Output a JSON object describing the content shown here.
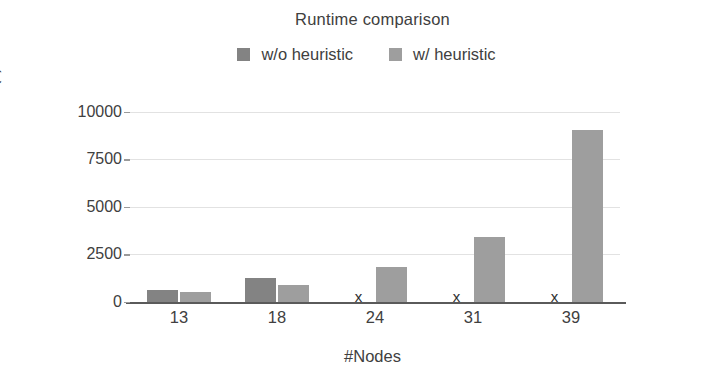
{
  "chart_data": {
    "type": "bar",
    "title": "Runtime comparison",
    "xlabel": "#Nodes",
    "ylabel": "Runtime (s)",
    "categories": [
      "13",
      "18",
      "24",
      "31",
      "39"
    ],
    "series": [
      {
        "name": "w/o heuristic",
        "color": "#838383",
        "values": [
          620,
          1270,
          null,
          null,
          null
        ],
        "missing_marker": "x"
      },
      {
        "name": "w/ heuristic",
        "color": "#9e9e9e",
        "values": [
          520,
          880,
          1820,
          3400,
          9050
        ]
      }
    ],
    "yticks": [
      0,
      2500,
      5000,
      7500,
      10000
    ],
    "ytick_labels": [
      "0",
      "2500",
      "5000",
      "7500",
      "10000"
    ],
    "ylim": [
      0,
      10400
    ],
    "grid": true,
    "legend_position": "top"
  },
  "legend": {
    "items": [
      {
        "label": "w/o heuristic",
        "color": "#838383"
      },
      {
        "label": "w/ heuristic",
        "color": "#9e9e9e"
      }
    ]
  },
  "axis": {
    "baseline_color": "#5a5a5a",
    "grid_color": "#e2e2e2"
  }
}
